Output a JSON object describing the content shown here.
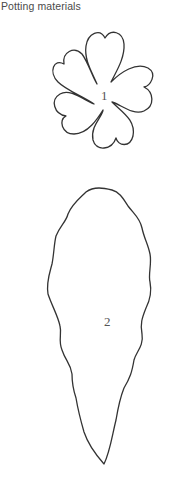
{
  "header": {
    "title": "Potting materials"
  },
  "templates": [
    {
      "id": "flower",
      "number": "1",
      "shape": "five-petal flower with heart-shaped petals"
    },
    {
      "id": "leaf",
      "number": "2",
      "shape": "elongated wavy-edged leaf"
    }
  ],
  "colors": {
    "outline": "#333333",
    "text": "#4a4a4a",
    "background": "#ffffff"
  }
}
